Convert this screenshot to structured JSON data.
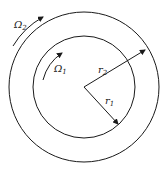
{
  "diagram": {
    "type": "concentric-cylinders",
    "colors": {
      "stroke": "#1a1a1a",
      "background": "#ffffff"
    },
    "outer_circle": {
      "label": "r",
      "subscript": "2",
      "cx": 84,
      "cy": 87,
      "r": 75
    },
    "inner_circle": {
      "label": "r",
      "subscript": "1",
      "cx": 84,
      "cy": 87,
      "r": 51
    },
    "outer_rotation": {
      "label": "Ω",
      "subscript": "2",
      "direction": "clockwise"
    },
    "inner_rotation": {
      "label": "Ω",
      "subscript": "1",
      "direction": "clockwise"
    }
  }
}
